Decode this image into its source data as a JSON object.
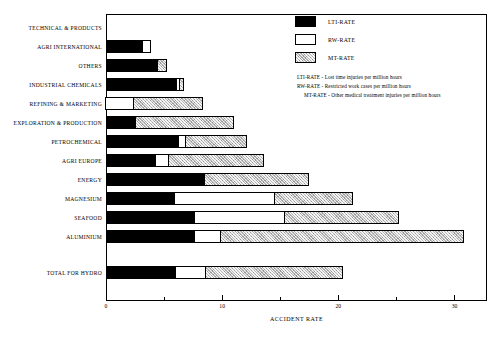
{
  "chart_data": {
    "type": "bar",
    "orientation": "horizontal",
    "stacked": true,
    "title": "",
    "xlabel": "ACCIDENT RATE",
    "ylabel": "",
    "xlim": [
      0,
      32.8
    ],
    "xticks_major": [
      0,
      10,
      20,
      30
    ],
    "xticks_minor": [
      5,
      15,
      25
    ],
    "xtick_labels": [
      "0",
      "10",
      "20",
      "30"
    ],
    "grid": false,
    "legend_position": "top-right",
    "series": [
      {
        "name": "LTI-RATE",
        "color": "#000000",
        "values": [
          0,
          3.2,
          4.5,
          6.1,
          0,
          2.6,
          6.3,
          4.3,
          8.5,
          5.9,
          7.7,
          7.7,
          6.0
        ]
      },
      {
        "name": "RW-RATE",
        "color": "#ffffff",
        "values": [
          0,
          0.8,
          0.0,
          0.35,
          2.5,
          0.0,
          0.7,
          1.2,
          0.0,
          8.7,
          7.8,
          2.3,
          2.7
        ]
      },
      {
        "name": "MT-RATE",
        "color": "#b9b9b9",
        "values": [
          0,
          0.0,
          0.8,
          0.45,
          6.0,
          8.5,
          5.3,
          8.3,
          9.1,
          6.8,
          9.9,
          21.0,
          11.9
        ]
      }
    ],
    "categories": [
      "TECHNICAL & PRODUCTS",
      "AGRI INTERNATIONAL",
      "OTHERS",
      "INDUSTRIAL CHEMICALS",
      "REFINING & MARKETING",
      "EXPLORATION & PRODUCTION",
      "PETROCHEMICAL",
      "AGRI EUROPE",
      "ENERGY",
      "MAGNESIUM",
      "SEAFOOD",
      "ALUMINIUM",
      "TOTAL FOR HYDRO"
    ],
    "totals": [
      0,
      4.0,
      5.3,
      6.9,
      8.5,
      11.1,
      12.3,
      13.8,
      17.6,
      21.4,
      25.4,
      31.0,
      20.6
    ]
  },
  "legend": {
    "items": [
      {
        "key": "lti",
        "label": "LTI-RATE"
      },
      {
        "key": "rw",
        "label": "RW-RATE"
      },
      {
        "key": "mt",
        "label": "MT-RATE"
      }
    ],
    "notes": [
      "LTI-RATE - Lost time injuries per million hours",
      "RW-RATE - Restricted work cases per million hours",
      "MT-RATE - Other medical treatment injuries per million hours"
    ]
  }
}
